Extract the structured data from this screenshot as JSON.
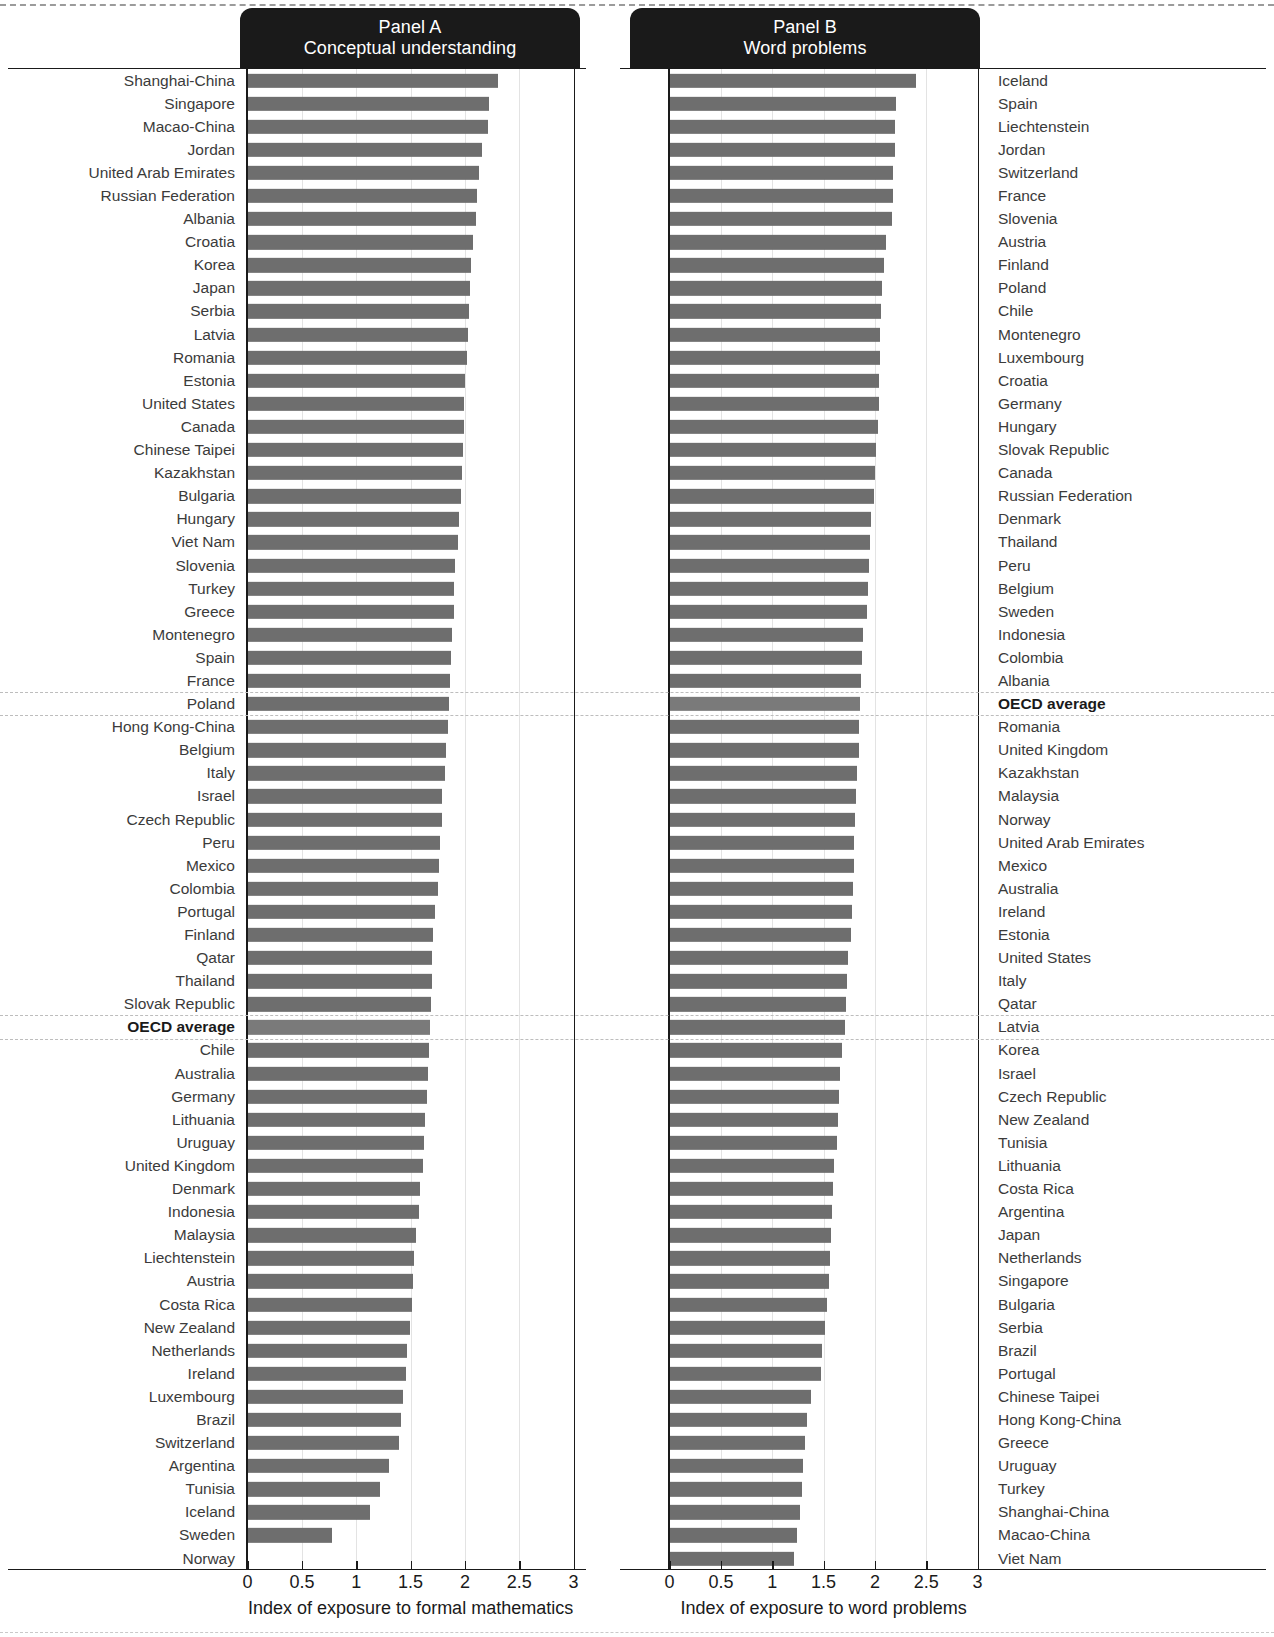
{
  "figure": {
    "panel_a": {
      "title_line1": "Panel A",
      "title_line2": "Conceptual understanding",
      "axis_title": "Index of exposure to formal mathematics",
      "tick_labels": [
        "0",
        "0.5",
        "1",
        "1.5",
        "2",
        "2.5",
        "3"
      ]
    },
    "panel_b": {
      "title_line1": "Panel B",
      "title_line2": "Word problems",
      "axis_title": "Index of exposure to word problems",
      "tick_labels": [
        "0",
        "0.5",
        "1",
        "1.5",
        "2",
        "2.5",
        "3"
      ]
    },
    "average_label": "OECD average",
    "bar_color": "#6e6e6e",
    "banner_color": "#1a1a1a"
  },
  "chart_data": [
    {
      "type": "bar",
      "title": "Panel A — Conceptual understanding",
      "orientation": "horizontal",
      "xlabel": "Index of exposure to formal mathematics",
      "ylabel": "",
      "xlim": [
        0,
        3
      ],
      "grid": true,
      "legend": "none",
      "categories": [
        "Shanghai-China",
        "Singapore",
        "Macao-China",
        "Jordan",
        "United Arab Emirates",
        "Russian Federation",
        "Albania",
        "Croatia",
        "Korea",
        "Japan",
        "Serbia",
        "Latvia",
        "Romania",
        "Estonia",
        "United States",
        "Canada",
        "Chinese Taipei",
        "Kazakhstan",
        "Bulgaria",
        "Hungary",
        "Viet Nam",
        "Slovenia",
        "Turkey",
        "Greece",
        "Montenegro",
        "Spain",
        "France",
        "Poland",
        "Hong Kong-China",
        "Belgium",
        "Italy",
        "Israel",
        "Czech Republic",
        "Peru",
        "Mexico",
        "Colombia",
        "Portugal",
        "Finland",
        "Qatar",
        "Thailand",
        "Slovak Republic",
        "OECD average",
        "Chile",
        "Australia",
        "Germany",
        "Lithuania",
        "Uruguay",
        "United Kingdom",
        "Denmark",
        "Indonesia",
        "Malaysia",
        "Liechtenstein",
        "Austria",
        "Costa Rica",
        "New Zealand",
        "Netherlands",
        "Ireland",
        "Luxembourg",
        "Brazil",
        "Switzerland",
        "Argentina",
        "Tunisia",
        "Iceland",
        "Sweden",
        "Norway"
      ],
      "values": [
        2.3,
        2.22,
        2.21,
        2.16,
        2.13,
        2.11,
        2.1,
        2.07,
        2.06,
        2.05,
        2.04,
        2.03,
        2.02,
        2.0,
        1.99,
        1.99,
        1.98,
        1.97,
        1.96,
        1.95,
        1.94,
        1.91,
        1.9,
        1.9,
        1.88,
        1.87,
        1.86,
        1.85,
        1.84,
        1.83,
        1.82,
        1.79,
        1.79,
        1.77,
        1.76,
        1.75,
        1.72,
        1.71,
        1.7,
        1.7,
        1.69,
        1.68,
        1.67,
        1.66,
        1.65,
        1.63,
        1.62,
        1.61,
        1.59,
        1.58,
        1.55,
        1.53,
        1.52,
        1.51,
        1.49,
        1.47,
        1.46,
        1.43,
        1.41,
        1.39,
        1.3,
        1.22,
        1.13,
        0.78,
        0.0
      ]
    },
    {
      "type": "bar",
      "title": "Panel B — Word problems",
      "orientation": "horizontal",
      "xlabel": "Index of exposure to word problems",
      "ylabel": "",
      "xlim": [
        0,
        3
      ],
      "grid": true,
      "legend": "none",
      "categories": [
        "Iceland",
        "Spain",
        "Liechtenstein",
        "Jordan",
        "Switzerland",
        "France",
        "Slovenia",
        "Austria",
        "Finland",
        "Poland",
        "Chile",
        "Montenegro",
        "Luxembourg",
        "Croatia",
        "Germany",
        "Hungary",
        "Slovak Republic",
        "Canada",
        "Russian Federation",
        "Denmark",
        "Thailand",
        "Peru",
        "Belgium",
        "Sweden",
        "Indonesia",
        "Colombia",
        "Albania",
        "OECD average",
        "Romania",
        "United Kingdom",
        "Kazakhstan",
        "Malaysia",
        "Norway",
        "United Arab Emirates",
        "Mexico",
        "Australia",
        "Ireland",
        "Estonia",
        "United States",
        "Italy",
        "Qatar",
        "Latvia",
        "Korea",
        "Israel",
        "Czech Republic",
        "New Zealand",
        "Tunisia",
        "Lithuania",
        "Costa Rica",
        "Argentina",
        "Japan",
        "Netherlands",
        "Singapore",
        "Bulgaria",
        "Serbia",
        "Brazil",
        "Portugal",
        "Chinese Taipei",
        "Hong Kong-China",
        "Greece",
        "Uruguay",
        "Turkey",
        "Shanghai-China",
        "Macao-China",
        "Viet Nam"
      ],
      "values": [
        2.4,
        2.21,
        2.2,
        2.2,
        2.18,
        2.18,
        2.17,
        2.11,
        2.09,
        2.07,
        2.06,
        2.05,
        2.05,
        2.04,
        2.04,
        2.03,
        2.01,
        2.0,
        1.99,
        1.96,
        1.95,
        1.94,
        1.93,
        1.92,
        1.88,
        1.87,
        1.86,
        1.85,
        1.84,
        1.84,
        1.83,
        1.82,
        1.81,
        1.8,
        1.8,
        1.79,
        1.78,
        1.77,
        1.74,
        1.73,
        1.72,
        1.71,
        1.68,
        1.66,
        1.65,
        1.64,
        1.63,
        1.6,
        1.59,
        1.58,
        1.57,
        1.56,
        1.55,
        1.53,
        1.51,
        1.48,
        1.47,
        1.38,
        1.34,
        1.32,
        1.3,
        1.29,
        1.27,
        1.24,
        1.21
      ]
    }
  ]
}
